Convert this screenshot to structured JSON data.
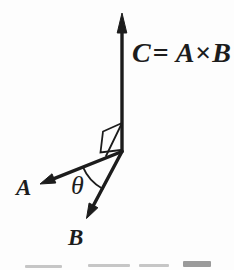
{
  "labels": {
    "c_equation": {
      "text": "C = A × B",
      "parts": {
        "lhs": "C",
        "equals": "=",
        "a": "A",
        "times": "×",
        "b": "B"
      }
    },
    "vector_a": "A",
    "vector_b": "B",
    "angle_theta": "θ"
  },
  "colors": {
    "ink": "#1c1c1c",
    "background": "#fdfdfd",
    "caption_fragment_light": "#c6c6c6",
    "caption_fragment_dark": "#9a9a9a"
  }
}
